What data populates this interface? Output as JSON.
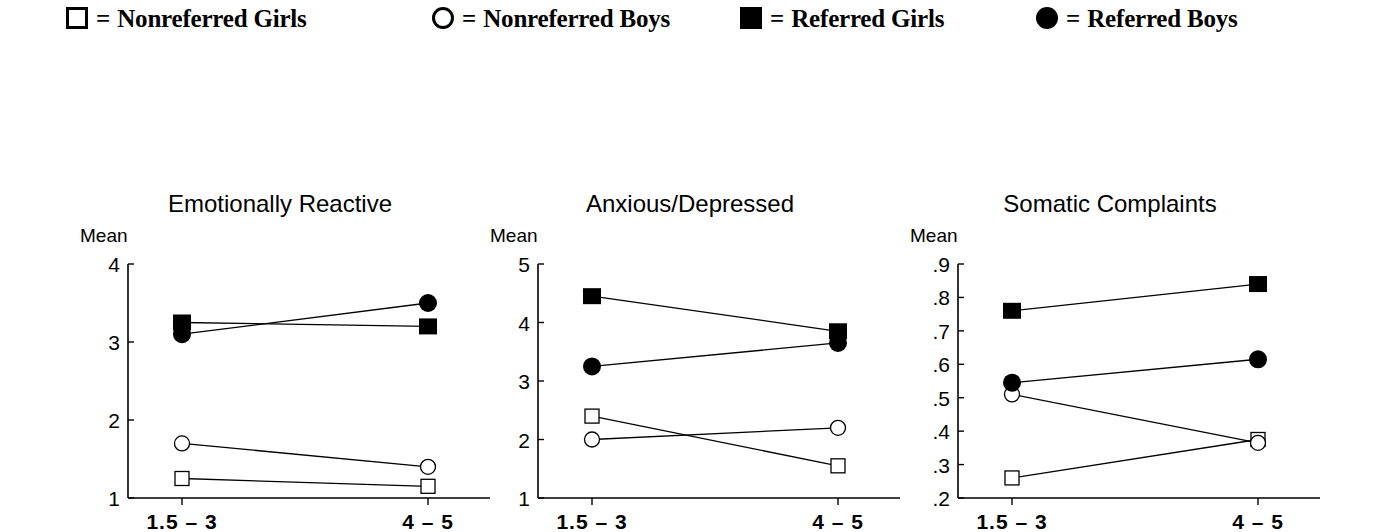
{
  "legend": {
    "items": [
      {
        "marker": "open-square",
        "marker_name": "open-square-marker-icon",
        "equals": "=",
        "label": "Nonreferred Girls",
        "x": 66
      },
      {
        "marker": "open-circle",
        "marker_name": "open-circle-marker-icon",
        "equals": "=",
        "label": "Nonreferred Boys",
        "x": 432
      },
      {
        "marker": "filled-square",
        "marker_name": "filled-square-marker-icon",
        "equals": "=",
        "label": "Referred Girls",
        "x": 740
      },
      {
        "marker": "filled-circle",
        "marker_name": "filled-circle-marker-icon",
        "equals": "=",
        "label": "Referred Boys",
        "x": 1036
      }
    ]
  },
  "axis_label": "Mean",
  "xlabels": [
    "1.5 – 3",
    "4 – 5"
  ],
  "chart_data": [
    {
      "type": "line",
      "title": "Emotionally Reactive",
      "xlabel": "",
      "ylabel": "Mean",
      "categories": [
        "1.5 – 3",
        "4 – 5"
      ],
      "yticks": [
        "1",
        "2",
        "3",
        "4"
      ],
      "ytick_values": [
        1,
        2,
        3,
        4
      ],
      "ylim": [
        1,
        4
      ],
      "grid": false,
      "legend_position": "top",
      "series": [
        {
          "name": "Nonreferred Girls",
          "marker": "open-square",
          "values": [
            1.25,
            1.15
          ]
        },
        {
          "name": "Nonreferred Boys",
          "marker": "open-circle",
          "values": [
            1.7,
            1.4
          ]
        },
        {
          "name": "Referred Girls",
          "marker": "filled-square",
          "values": [
            3.25,
            3.2
          ]
        },
        {
          "name": "Referred Boys",
          "marker": "filled-circle",
          "values": [
            3.1,
            3.5
          ]
        }
      ]
    },
    {
      "type": "line",
      "title": "Anxious/Depressed",
      "xlabel": "",
      "ylabel": "Mean",
      "categories": [
        "1.5 – 3",
        "4 – 5"
      ],
      "yticks": [
        "1",
        "2",
        "3",
        "4",
        "5"
      ],
      "ytick_values": [
        1,
        2,
        3,
        4,
        5
      ],
      "ylim": [
        1,
        5
      ],
      "grid": false,
      "legend_position": "top",
      "series": [
        {
          "name": "Nonreferred Girls",
          "marker": "open-square",
          "values": [
            2.4,
            1.55
          ]
        },
        {
          "name": "Nonreferred Boys",
          "marker": "open-circle",
          "values": [
            2.0,
            2.2
          ]
        },
        {
          "name": "Referred Girls",
          "marker": "filled-square",
          "values": [
            4.45,
            3.85
          ]
        },
        {
          "name": "Referred Boys",
          "marker": "filled-circle",
          "values": [
            3.25,
            3.65
          ]
        }
      ]
    },
    {
      "type": "line",
      "title": "Somatic Complaints",
      "xlabel": "",
      "ylabel": "Mean",
      "categories": [
        "1.5 – 3",
        "4 – 5"
      ],
      "yticks": [
        ".2",
        ".3",
        ".4",
        ".5",
        ".6",
        ".7",
        ".8",
        ".9"
      ],
      "ytick_values": [
        0.2,
        0.3,
        0.4,
        0.5,
        0.6,
        0.7,
        0.8,
        0.9
      ],
      "ylim": [
        0.2,
        0.9
      ],
      "grid": false,
      "legend_position": "top",
      "series": [
        {
          "name": "Nonreferred Girls",
          "marker": "open-square",
          "values": [
            0.26,
            0.375
          ]
        },
        {
          "name": "Nonreferred Boys",
          "marker": "open-circle",
          "values": [
            0.51,
            0.365
          ]
        },
        {
          "name": "Referred Girls",
          "marker": "filled-square",
          "values": [
            0.76,
            0.84
          ]
        },
        {
          "name": "Referred Boys",
          "marker": "filled-circle",
          "values": [
            0.545,
            0.615
          ]
        }
      ]
    }
  ]
}
